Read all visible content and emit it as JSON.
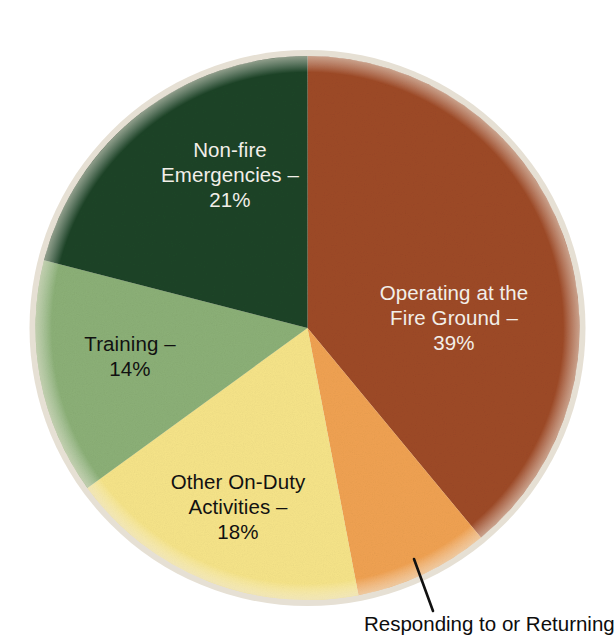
{
  "chart_data": {
    "type": "pie",
    "title": "",
    "subtitle": "",
    "xlabel": "",
    "ylabel": "",
    "legend_position": "none",
    "grid": false,
    "units": "percent",
    "start_angle_deg": 0,
    "direction": "clockwise",
    "categories": [
      "Operating at the Fire Ground",
      "Responding to or Returning",
      "Other On-Duty Activities",
      "Training",
      "Non-fire Emergencies"
    ],
    "values": [
      39,
      8,
      18,
      14,
      21
    ],
    "colors": [
      "#9E4A26",
      "#F0A252",
      "#F6E489",
      "#8CB077",
      "#1E4428"
    ],
    "slices": [
      {
        "key": "fire-ground",
        "name": "Operating at the Fire Ground",
        "value": 39,
        "percent_text": "39%",
        "color": "#9E4A26",
        "label_lines": [
          "Operating at the",
          "Fire Ground –",
          "39%"
        ],
        "label_color": "#f2efe9",
        "label_placement": "inside"
      },
      {
        "key": "responding",
        "name": "Responding to or Returning",
        "value": 8,
        "percent_text": "",
        "color": "#F0A252",
        "label_lines": [
          "Responding to or Returning"
        ],
        "label_color": "#0d0d0d",
        "label_placement": "callout"
      },
      {
        "key": "other-on-duty",
        "name": "Other On-Duty Activities",
        "value": 18,
        "percent_text": "18%",
        "color": "#F6E489",
        "label_lines": [
          "Other On-Duty",
          "Activities –",
          "18%"
        ],
        "label_color": "#111111",
        "label_placement": "inside"
      },
      {
        "key": "training",
        "name": "Training",
        "value": 14,
        "percent_text": "14%",
        "color": "#8CB077",
        "label_lines": [
          "Training –",
          "14%"
        ],
        "label_color": "#111111",
        "label_placement": "inside"
      },
      {
        "key": "non-fire-emergencies",
        "name": "Non-fire Emergencies",
        "value": 21,
        "percent_text": "21%",
        "color": "#1E4428",
        "label_lines": [
          "Non-fire",
          "Emergencies –",
          "21%"
        ],
        "label_color": "#f2efe9",
        "label_placement": "inside"
      }
    ]
  },
  "labels": {
    "fire_ground": "Operating at the\nFire Ground –\n39%",
    "non_fire": "Non-fire\nEmergencies –\n21%",
    "training": "Training –\n14%",
    "other_on_duty": "Other On-Duty\nActivities –\n18%",
    "responding_caption": "Responding to or Returning"
  },
  "theme": {
    "background": "#ffffff",
    "fire_ground_color": "#9E4A26",
    "responding_color": "#F0A252",
    "other_on_duty_color": "#F6E489",
    "training_color": "#8CB077",
    "non_fire_color": "#1E4428",
    "rim_color": "#e6e0d4",
    "leader_line_color": "#111111"
  }
}
